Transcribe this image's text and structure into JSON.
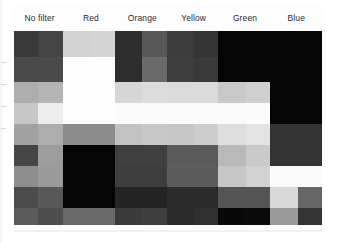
{
  "figure": {
    "kind": "grayscale-filter-comparison-chart"
  },
  "header": {
    "columns": [
      {
        "label": "No filter"
      },
      {
        "label": "Red"
      },
      {
        "label": "Orange"
      },
      {
        "label": "Yellow"
      },
      {
        "label": "Green"
      },
      {
        "label": "Blue"
      }
    ]
  },
  "chart_data": {
    "type": "heatmap",
    "title": "",
    "xlabel": "",
    "ylabel": "",
    "categories": [
      "No filter",
      "Red",
      "Orange",
      "Yellow",
      "Green",
      "Blue"
    ],
    "rows": 9,
    "columns": 6,
    "swatches_per_column": 2,
    "legend_position": "top",
    "grid": false,
    "note": "Each cell value is a grayscale level 0-255 as rendered in the scan",
    "matrix": [
      [
        {
          "col": "No filter",
          "cells": [
            "#3a3a3a",
            "#444444"
          ]
        },
        {
          "col": "Red",
          "cells": [
            "#d2d2d2",
            "#d4d4d4"
          ]
        },
        {
          "col": "Orange",
          "cells": [
            "#2e2e2e",
            "#585858"
          ]
        },
        {
          "col": "Yellow",
          "cells": [
            "#3b3b3b",
            "#343434"
          ]
        },
        {
          "col": "Green",
          "cells": [
            "#050505",
            "#050505"
          ]
        },
        {
          "col": "Blue",
          "cells": [
            "#050505",
            "#050505"
          ]
        }
      ],
      [
        {
          "col": "No filter",
          "cells": [
            "#4a4a4a",
            "#4a4a4a"
          ]
        },
        {
          "col": "Red",
          "cells": [
            "#fdfdfd",
            "#fdfdfd"
          ]
        },
        {
          "col": "Orange",
          "cells": [
            "#2d2d2d",
            "#6a6a6a"
          ]
        },
        {
          "col": "Yellow",
          "cells": [
            "#3d3d3d",
            "#3a3a3a"
          ]
        },
        {
          "col": "Green",
          "cells": [
            "#050505",
            "#050505"
          ]
        },
        {
          "col": "Blue",
          "cells": [
            "#050505",
            "#050505"
          ]
        }
      ],
      [
        {
          "col": "No filter",
          "cells": [
            "#adadad",
            "#b5b5b5"
          ]
        },
        {
          "col": "Red",
          "cells": [
            "#fdfdfd",
            "#fdfdfd"
          ]
        },
        {
          "col": "Orange",
          "cells": [
            "#d6d6d6",
            "#dcdcdc"
          ]
        },
        {
          "col": "Yellow",
          "cells": [
            "#dadada",
            "#dadada"
          ]
        },
        {
          "col": "Green",
          "cells": [
            "#c9c9c9",
            "#cfcfcf"
          ]
        },
        {
          "col": "Blue",
          "cells": [
            "#050505",
            "#050505"
          ]
        }
      ],
      [
        {
          "col": "No filter",
          "cells": [
            "#c6c6c6",
            "#ededed"
          ]
        },
        {
          "col": "Red",
          "cells": [
            "#fdfdfd",
            "#fdfdfd"
          ]
        },
        {
          "col": "Orange",
          "cells": [
            "#fbfbfb",
            "#fbfbfb"
          ]
        },
        {
          "col": "Yellow",
          "cells": [
            "#fbfbfb",
            "#fbfbfb"
          ]
        },
        {
          "col": "Green",
          "cells": [
            "#fbfbfb",
            "#fbfbfb"
          ]
        },
        {
          "col": "Blue",
          "cells": [
            "#050505",
            "#050505"
          ]
        }
      ],
      [
        {
          "col": "No filter",
          "cells": [
            "#a2a2a2",
            "#adadad"
          ]
        },
        {
          "col": "Red",
          "cells": [
            "#8c8c8c",
            "#8c8c8c"
          ]
        },
        {
          "col": "Orange",
          "cells": [
            "#c2c2c2",
            "#c8c8c8"
          ]
        },
        {
          "col": "Yellow",
          "cells": [
            "#c6c6c6",
            "#cdcdcd"
          ]
        },
        {
          "col": "Green",
          "cells": [
            "#dedede",
            "#e3e3e3"
          ]
        },
        {
          "col": "Blue",
          "cells": [
            "#333333",
            "#333333"
          ]
        }
      ],
      [
        {
          "col": "No filter",
          "cells": [
            "#464646",
            "#9d9d9d"
          ]
        },
        {
          "col": "Red",
          "cells": [
            "#050505",
            "#050505"
          ]
        },
        {
          "col": "Orange",
          "cells": [
            "#3f3f3f",
            "#3f3f3f"
          ]
        },
        {
          "col": "Yellow",
          "cells": [
            "#5a5a5a",
            "#5a5a5a"
          ]
        },
        {
          "col": "Green",
          "cells": [
            "#b9b9b9",
            "#cacaca"
          ]
        },
        {
          "col": "Blue",
          "cells": [
            "#333333",
            "#333333"
          ]
        }
      ],
      [
        {
          "col": "No filter",
          "cells": [
            "#8e8e8e",
            "#9b9b9b"
          ]
        },
        {
          "col": "Red",
          "cells": [
            "#050505",
            "#050505"
          ]
        },
        {
          "col": "Orange",
          "cells": [
            "#3d3d3d",
            "#3d3d3d"
          ]
        },
        {
          "col": "Yellow",
          "cells": [
            "#5c5c5c",
            "#5c5c5c"
          ]
        },
        {
          "col": "Green",
          "cells": [
            "#c6c6c6",
            "#d2d2d2"
          ]
        },
        {
          "col": "Blue",
          "cells": [
            "#fbfbfb",
            "#fbfbfb"
          ]
        }
      ],
      [
        {
          "col": "No filter",
          "cells": [
            "#4b4b4b",
            "#585858"
          ]
        },
        {
          "col": "Red",
          "cells": [
            "#050505",
            "#050505"
          ]
        },
        {
          "col": "Orange",
          "cells": [
            "#242424",
            "#242424"
          ]
        },
        {
          "col": "Yellow",
          "cells": [
            "#2b2b2b",
            "#2b2b2b"
          ]
        },
        {
          "col": "Green",
          "cells": [
            "#555555",
            "#555555"
          ]
        },
        {
          "col": "Blue",
          "cells": [
            "#d9d9d9",
            "#666666"
          ]
        }
      ],
      [
        {
          "col": "No filter",
          "cells": [
            "#5b5b5b",
            "#4d4d4d"
          ]
        },
        {
          "col": "Red",
          "cells": [
            "#6a6a6a",
            "#6a6a6a"
          ]
        },
        {
          "col": "Orange",
          "cells": [
            "#3a3a3a",
            "#3e3e3e"
          ]
        },
        {
          "col": "Yellow",
          "cells": [
            "#2a2a2a",
            "#2f2f2f"
          ]
        },
        {
          "col": "Green",
          "cells": [
            "#080808",
            "#0a0a0a"
          ]
        },
        {
          "col": "Blue",
          "cells": [
            "#9a9a9a",
            "#343434"
          ]
        }
      ]
    ]
  }
}
